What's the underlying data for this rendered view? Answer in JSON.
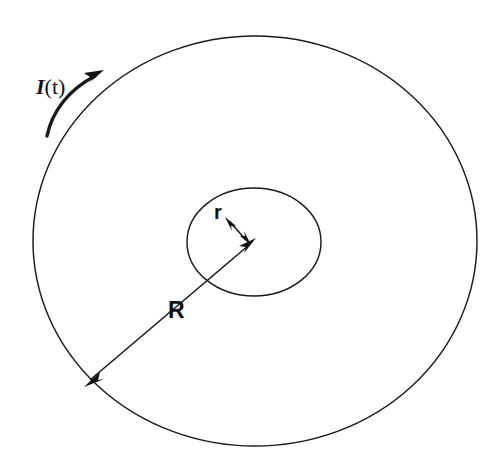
{
  "figure": {
    "background_color": "#ffffff",
    "line_color": "#1a1a1a"
  },
  "labels": {
    "current": {
      "symbol": "I",
      "argument": "(t)",
      "full_text": "I(t)",
      "style": "italic-serif",
      "x": 36,
      "y": 94
    },
    "outer_radius": {
      "text": "R",
      "style": "bold-sans",
      "x": 168,
      "y": 318
    },
    "inner_radius": {
      "text": "r",
      "style": "bold-sans",
      "x": 214,
      "y": 219
    }
  },
  "shapes": {
    "outer_circle": {
      "name": "outer-circle",
      "cx": 255,
      "cy": 241,
      "rx": 222,
      "ry": 205,
      "stroke_width": 1.45
    },
    "inner_circle": {
      "name": "inner-circle",
      "cx": 254,
      "cy": 242,
      "rx": 67,
      "ry": 54,
      "stroke_width": 1.45
    }
  },
  "annotations": {
    "radius_R_arrow": {
      "name": "outer-radius-arrow",
      "from_x": 86,
      "from_y": 384,
      "to_x": 253,
      "to_y": 241,
      "arrowheads": "both"
    },
    "radius_r_arrow": {
      "name": "inner-radius-arrow",
      "from_x": 227,
      "from_y": 219,
      "to_x": 249,
      "to_y": 243,
      "arrowheads": "both"
    },
    "current_arc_arrow": {
      "name": "current-direction-arrow",
      "start_x": 47,
      "start_y": 136,
      "end_x": 101,
      "end_y": 72,
      "direction": "counterclockwise-to-clockwise-upward",
      "arrowheads": "end"
    }
  }
}
